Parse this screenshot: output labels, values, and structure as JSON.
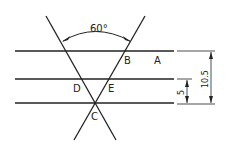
{
  "diagram": {
    "angle_label": "60°",
    "points": {
      "A": "A",
      "B": "B",
      "C": "C",
      "D": "D",
      "E": "E"
    },
    "dimensions": {
      "outer": "10.5",
      "inner": "5"
    }
  }
}
